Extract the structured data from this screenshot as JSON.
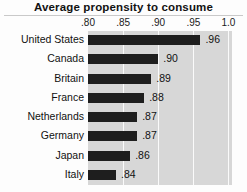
{
  "chart_data": {
    "type": "bar",
    "title": "Average propensity to consume",
    "xlabel": "",
    "ylabel": "",
    "orientation": "horizontal",
    "categories": [
      "United States",
      "Canada",
      "Britain",
      "France",
      "Netherlands",
      "Germany",
      "Japan",
      "Italy"
    ],
    "values": [
      0.96,
      0.9,
      0.89,
      0.88,
      0.87,
      0.87,
      0.86,
      0.84
    ],
    "value_labels": [
      ".96",
      ".90",
      ".89",
      ".88",
      ".87",
      ".87",
      ".86",
      ".84"
    ],
    "xlim": [
      0.8,
      1.005
    ],
    "xticks": [
      0.8,
      0.85,
      0.9,
      0.95,
      1.0
    ],
    "xtick_labels": [
      ".80",
      ".85",
      ".90",
      ".95",
      "1.0"
    ],
    "grid": true,
    "grid_axis": "x",
    "legend": "none",
    "bar_color": "#1e1e1e",
    "plot_background": "#d7d7d7",
    "gridline_color": "#fafafa"
  }
}
